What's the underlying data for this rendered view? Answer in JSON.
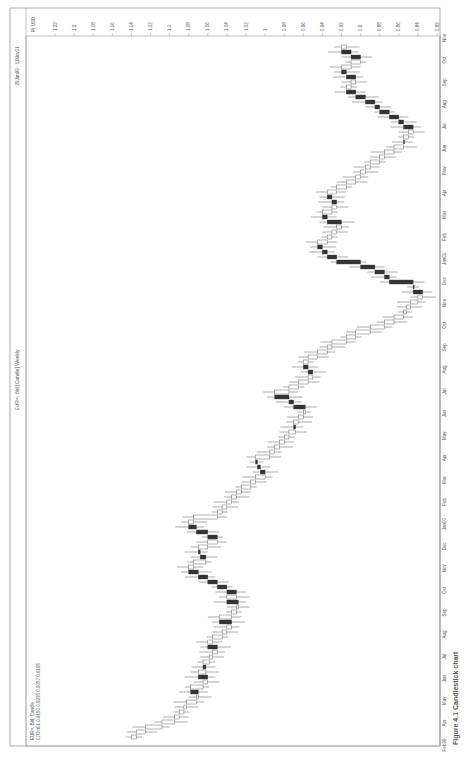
{
  "chart_data": {
    "type": "candlestick",
    "orientation": "rotated-90-clockwise",
    "title": "EUR=, Bid [Candle] Weekly",
    "date_range": "29Jan99 - 11Nov01",
    "legend": {
      "series_label": "EUR=, Bid, Candle",
      "last_values": "07Oct01 0.9150 0.9235 0.9057 0.9195"
    },
    "price_axis": {
      "unit_label": "Pr USD",
      "ticks": [
        "1.22",
        "1.2",
        "1.18",
        "1.16",
        "1.14",
        "1.12",
        "1.1",
        "1.08",
        "1.06",
        "1.04",
        "1.02",
        "1",
        "0.98",
        "0.96",
        "0.94",
        "0.92",
        "0.9",
        "0.88",
        "0.86",
        "0.84",
        "0.82"
      ],
      "range": [
        0.82,
        1.24
      ]
    },
    "time_axis": {
      "ticks": [
        "Feb99",
        "Apr",
        "May",
        "Jun",
        "Jul",
        "Aug",
        "Sep",
        "Oct",
        "Nov",
        "Dec",
        "Jan00",
        "Feb",
        "Mar",
        "Apr",
        "May",
        "Jun",
        "Jul",
        "Aug",
        "Sep",
        "Oct",
        "Nov",
        "Dec",
        "Jan01",
        "Feb",
        "Mar",
        "Apr",
        "May",
        "Jun",
        "Jul",
        "Aug",
        "Sep",
        "Oct",
        "Nov"
      ],
      "range": [
        "Feb99",
        "Nov01"
      ]
    },
    "caption": "Figure 4.1  Candlestick chart",
    "series": [
      {
        "name": "EUR= weekly close (approx)",
        "weekly_close": [
          1.135,
          1.125,
          1.108,
          1.095,
          1.09,
          1.085,
          1.082,
          1.072,
          1.07,
          1.078,
          1.065,
          1.06,
          1.07,
          1.062,
          1.065,
          1.058,
          1.055,
          1.05,
          1.06,
          1.055,
          1.045,
          1.04,
          1.035,
          1.048,
          1.035,
          1.03,
          1.028,
          1.04,
          1.03,
          1.04,
          1.05,
          1.06,
          1.07,
          1.08,
          1.075,
          1.062,
          1.068,
          1.07,
          1.06,
          1.05,
          1.06,
          1.072,
          1.08,
          1.075,
          1.05,
          1.045,
          1.04,
          1.035,
          1.03,
          1.025,
          1.015,
          1.01,
          1.0,
          1.005,
          1.008,
          1.01,
          0.995,
          0.99,
          0.985,
          0.98,
          0.975,
          0.968,
          0.97,
          0.965,
          0.96,
          0.958,
          0.97,
          0.975,
          0.99,
          0.975,
          0.965,
          0.955,
          0.95,
          0.955,
          0.96,
          0.955,
          0.945,
          0.935,
          0.93,
          0.915,
          0.905,
          0.89,
          0.875,
          0.865,
          0.855,
          0.852,
          0.848,
          0.84,
          0.835,
          0.845,
          0.845,
          0.87,
          0.875,
          0.885,
          0.9,
          0.925,
          0.935,
          0.94,
          0.945,
          0.935,
          0.93,
          0.925,
          0.92,
          0.935,
          0.94,
          0.93,
          0.925,
          0.93,
          0.935,
          0.925,
          0.915,
          0.905,
          0.9,
          0.895,
          0.89,
          0.88,
          0.875,
          0.865,
          0.855,
          0.855,
          0.85,
          0.845,
          0.855,
          0.86,
          0.87,
          0.88,
          0.885,
          0.895,
          0.905,
          0.915,
          0.91,
          0.905,
          0.915,
          0.92,
          0.91,
          0.9,
          0.91,
          0.92,
          0.915
        ]
      }
    ]
  }
}
